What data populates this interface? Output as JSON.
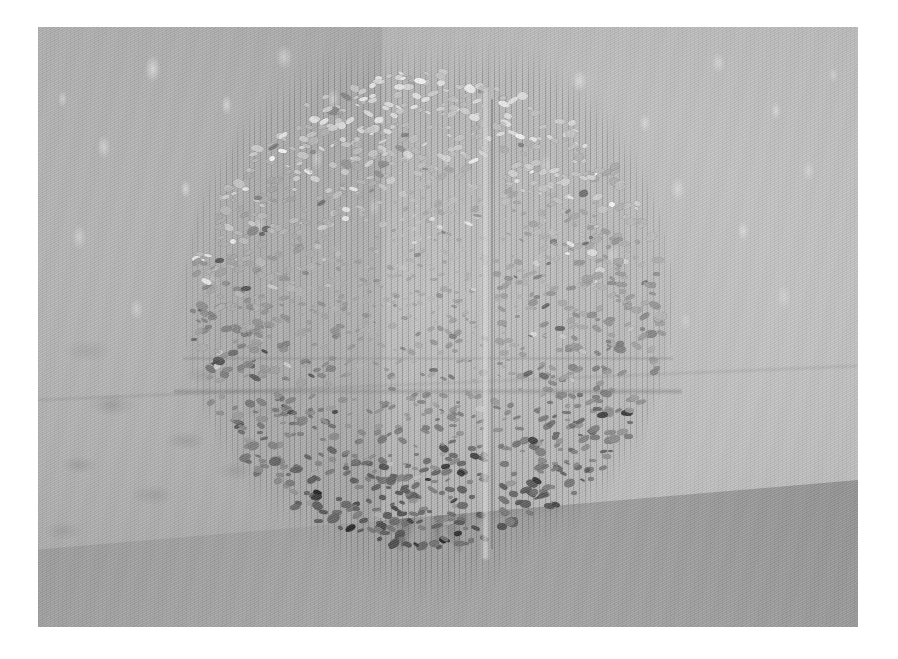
{
  "image": {
    "kind": "photograph",
    "subject": "suspended-sphere-sculpture",
    "title": "Suspended sphere of small reflective elements in a gallery corner",
    "orientation": "landscape",
    "color_mode": "monochrome / desaturated greyscale",
    "plate": {
      "x": 38,
      "y": 27,
      "width": 820,
      "height": 600
    },
    "canvas": {
      "width": 898,
      "height": 659,
      "background": "#ffffff"
    }
  },
  "scene": {
    "setting": "gallery interior corner",
    "light": "diffuse overhead light producing dappled highlights on walls",
    "elements": [
      {
        "name": "left-wall",
        "tone": "#b2b2b2",
        "note": "mottled grey with soft shadow blotches"
      },
      {
        "name": "right-wall",
        "tone": "#bdbdbd",
        "note": "lighter, speckled with bright dapples"
      },
      {
        "name": "corner-seam",
        "note": "vertical junction of the two walls behind the sphere"
      },
      {
        "name": "floor",
        "tone": "#a3a3a3",
        "note": "receding plane with cast shadow radiating from sphere"
      }
    ]
  },
  "sculpture": {
    "form": "sphere",
    "construction": "hundreds of small flat chips suspended on fine vertical threads",
    "bounds": {
      "x": 150,
      "y": 52,
      "width": 480,
      "height": 490
    },
    "features": [
      {
        "name": "equator-band",
        "description": "horizontal gap/seam across the sphere middle"
      },
      {
        "name": "meridian-gap",
        "description": "vertical pale gap dividing the sphere left/right"
      },
      {
        "name": "thread-array",
        "description": "vertical monofilament lines extending above and below"
      },
      {
        "name": "chip-cluster-dense-lower",
        "description": "chips read darker toward the lower hemisphere"
      },
      {
        "name": "chip-cluster-bright-upper",
        "description": "chips read lighter/specular toward the crown"
      }
    ],
    "palette": {
      "chip_dark": "#4a4a4a",
      "chip_mid": "#808080",
      "chip_light": "#d6d6d6",
      "chip_specular": "#f2f2f2",
      "thread": "#6e6e6e"
    }
  },
  "overlays": {
    "has_text": false,
    "has_ui_chrome": false,
    "annotations": []
  }
}
